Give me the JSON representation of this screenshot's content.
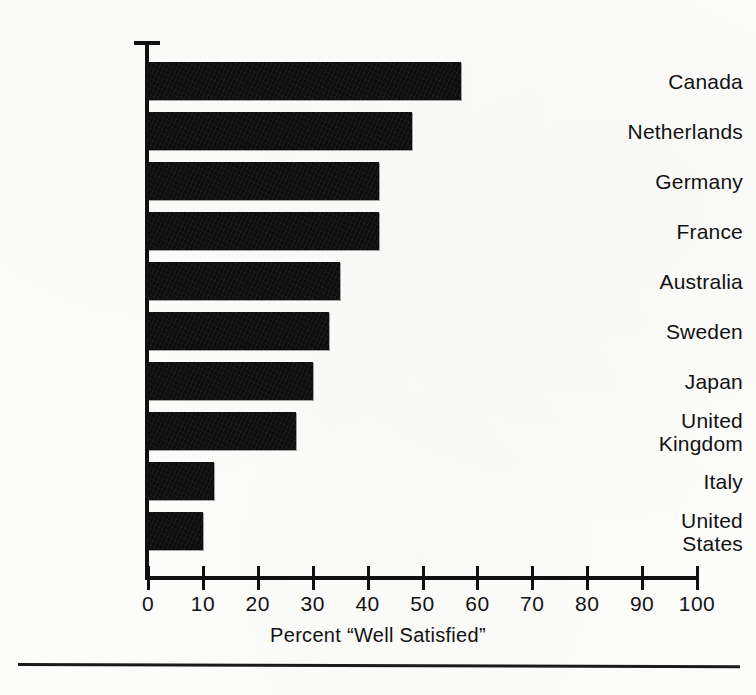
{
  "chart_data": {
    "type": "bar",
    "orientation": "horizontal",
    "title": "",
    "subtitle": "",
    "xlabel": "Percent “Well Satisfied”",
    "ylabel": "",
    "categories": [
      "Canada",
      "Netherlands",
      "Germany",
      "France",
      "Australia",
      "Sweden",
      "Japan",
      "United Kingdom",
      "Italy",
      "United States"
    ],
    "values": [
      57,
      48,
      42,
      42,
      35,
      33,
      30,
      27,
      12,
      10
    ],
    "xlim": [
      0,
      100
    ],
    "xticks": [
      0,
      10,
      20,
      30,
      40,
      50,
      60,
      70,
      80,
      90,
      100
    ],
    "xtick_labels": [
      "0",
      "10",
      "20",
      "30",
      "40",
      "50",
      "60",
      "70",
      "80",
      "90",
      "100"
    ],
    "grid": false,
    "legend": null,
    "legend_position": "none",
    "bar_color": "#0d0d0d",
    "axis_color": "#101010",
    "background_color": "#fcfcfa"
  },
  "labels": {
    "canada": "Canada",
    "netherlands": "Netherlands",
    "germany": "Germany",
    "france": "France",
    "australia": "Australia",
    "sweden": "Sweden",
    "japan": "Japan",
    "united_kingdom_line1": "United",
    "united_kingdom_line2": "Kingdom",
    "italy": "Italy",
    "united_states_line1": "United",
    "united_states_line2": "States"
  },
  "axis": {
    "x_title": "Percent “Well Satisfied”"
  }
}
